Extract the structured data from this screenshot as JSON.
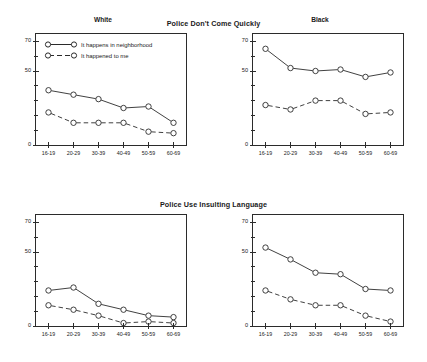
{
  "chart_data": [
    {
      "type": "line",
      "title": "Police Don't Come Quickly",
      "panel": "White",
      "xlabel": "",
      "ylabel": "",
      "categories": [
        "16-19",
        "20-29",
        "30-39",
        "40-49",
        "50-59",
        "60-69"
      ],
      "ylim": [
        0,
        75
      ],
      "yticks_labeled": [
        0,
        50,
        70
      ],
      "yticks_minor": [
        10,
        20,
        30,
        40,
        60
      ],
      "grid": false,
      "legend_position": "top-left",
      "series": [
        {
          "name": "It happens in neighborhood",
          "style": "solid",
          "marker": "open-circle",
          "values": [
            37,
            34,
            31,
            25,
            26,
            15
          ]
        },
        {
          "name": "It happened to me",
          "style": "dashed",
          "marker": "open-circle",
          "values": [
            22,
            15,
            15,
            15,
            9,
            8
          ]
        }
      ]
    },
    {
      "type": "line",
      "title": "Police Don't Come Quickly",
      "panel": "Black",
      "xlabel": "",
      "ylabel": "",
      "categories": [
        "16-19",
        "20-29",
        "30-39",
        "40-49",
        "50-59",
        "60-69"
      ],
      "ylim": [
        0,
        75
      ],
      "yticks_labeled": [
        0,
        50,
        70
      ],
      "yticks_minor": [
        10,
        20,
        30,
        40,
        60
      ],
      "grid": false,
      "legend_position": "none",
      "series": [
        {
          "name": "It happens in neighborhood",
          "style": "solid",
          "marker": "open-circle",
          "values": [
            65,
            52,
            50,
            51,
            46,
            49
          ]
        },
        {
          "name": "It happened to me",
          "style": "dashed",
          "marker": "open-circle",
          "values": [
            27,
            24,
            30,
            30,
            21,
            22
          ]
        }
      ]
    },
    {
      "type": "line",
      "title": "Police Use Insulting Language",
      "panel": "White",
      "xlabel": "",
      "ylabel": "",
      "categories": [
        "16-19",
        "20-29",
        "30-39",
        "40-49",
        "50-59",
        "60-69"
      ],
      "ylim": [
        0,
        75
      ],
      "yticks_labeled": [
        0,
        50,
        70
      ],
      "yticks_minor": [
        10,
        20,
        30,
        40,
        60
      ],
      "grid": false,
      "legend_position": "none",
      "series": [
        {
          "name": "It happens in neighborhood",
          "style": "solid",
          "marker": "open-circle",
          "values": [
            24,
            26,
            15,
            11,
            7,
            6
          ]
        },
        {
          "name": "It happened to me",
          "style": "dashed",
          "marker": "open-circle",
          "values": [
            14,
            11,
            7,
            2,
            3,
            2
          ]
        }
      ]
    },
    {
      "type": "line",
      "title": "Police Use Insulting Language",
      "panel": "Black",
      "xlabel": "",
      "ylabel": "",
      "categories": [
        "16-19",
        "20-29",
        "30-39",
        "40-49",
        "50-59",
        "60-69"
      ],
      "ylim": [
        0,
        75
      ],
      "yticks_labeled": [
        0,
        50,
        70
      ],
      "yticks_minor": [
        10,
        20,
        30,
        40,
        60
      ],
      "grid": false,
      "legend_position": "none",
      "series": [
        {
          "name": "It happens in neighborhood",
          "style": "solid",
          "marker": "open-circle",
          "values": [
            53,
            45,
            36,
            35,
            25,
            24
          ]
        },
        {
          "name": "It happened to me",
          "style": "dashed",
          "marker": "open-circle",
          "values": [
            24,
            18,
            14,
            14,
            7,
            3
          ]
        }
      ]
    }
  ],
  "sections": {
    "top": {
      "title": "Police Don't Come Quickly",
      "left_panel_title": "White",
      "right_panel_title": "Black"
    },
    "bottom": {
      "title": "Police Use Insulting Language",
      "left_panel_title": "White",
      "right_panel_title": "Black"
    }
  },
  "legend": {
    "items": [
      {
        "label": "It happens in neighborhood",
        "style": "solid"
      },
      {
        "label": "It happened to me",
        "style": "dashed"
      }
    ]
  },
  "axis": {
    "y_labels": [
      "70",
      "50",
      "0"
    ],
    "x_labels": [
      "16-19",
      "20-29",
      "30-39",
      "40-49",
      "50-59",
      "60-69"
    ]
  },
  "colors": {
    "line": "#2b2b2b",
    "frame": "#2b2b2b",
    "background": "#ffffff",
    "text": "#1a1a1a"
  }
}
